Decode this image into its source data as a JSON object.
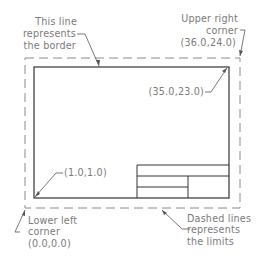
{
  "diagram": {
    "annotations": {
      "border": {
        "lines": [
          "This line",
          "represents",
          "the border"
        ]
      },
      "upper_right": {
        "lines": [
          "Upper right",
          "corner",
          "(36.0,24.0)"
        ]
      },
      "inner_upper_right": {
        "text": "(35.0,23.0)"
      },
      "inner_lower_left": {
        "text": "(1.0,1.0)"
      },
      "lower_left": {
        "lines": [
          "Lower left",
          "corner",
          "(0.0,0.0)"
        ]
      },
      "limits": {
        "lines": [
          "Dashed lines",
          "represents",
          "the limits"
        ]
      }
    },
    "colors": {
      "border_line": "#333333",
      "dashed_line": "#8a8a8a",
      "text": "#7a7a7a",
      "leader": "#555555"
    }
  }
}
